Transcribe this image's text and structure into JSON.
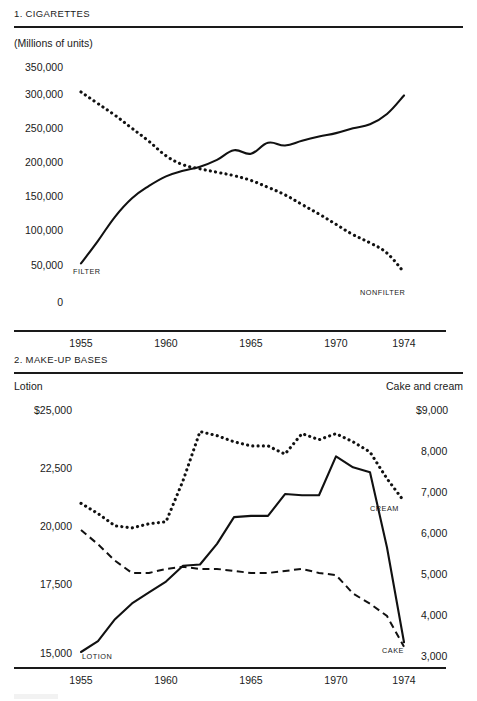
{
  "page": {
    "background": "#ffffff",
    "ink": "#111111"
  },
  "panels": [
    {
      "id": "cigarettes",
      "number_title": "1. CIGARETTES",
      "unit_label": "(Millions of units)",
      "y_ticks": [
        "350,000",
        "300,000",
        "250,000",
        "200,000",
        "150,000",
        "100,000",
        "50,000",
        "0"
      ],
      "x_ticks": [
        "1955",
        "1960",
        "1965",
        "1970",
        "1974"
      ],
      "series_labels": [
        {
          "name": "filter-label",
          "text": "FILTER"
        },
        {
          "name": "nonfilter-label",
          "text": "NONFILTER"
        }
      ]
    },
    {
      "id": "makeup",
      "number_title": "2. MAKE-UP BASES",
      "left_axis_title": "Lotion",
      "right_axis_title": "Cake and cream",
      "y_ticks_left": [
        "$25,000",
        "22,500",
        "20,000",
        "17,500",
        "15,000"
      ],
      "y_ticks_right": [
        "$9,000",
        "8,000",
        "7,000",
        "6,000",
        "5,000",
        "4,000",
        "3,000"
      ],
      "x_ticks": [
        "1955",
        "1960",
        "1965",
        "1970",
        "1974"
      ],
      "series_labels": [
        {
          "name": "lotion-label",
          "text": "LOTION"
        },
        {
          "name": "cream-label",
          "text": "CREAM"
        },
        {
          "name": "cake-label",
          "text": "CAKE"
        }
      ]
    }
  ],
  "chart_data": [
    {
      "type": "line",
      "title": "1. CIGARETTES",
      "subtitle": "(Millions of units)",
      "xlabel": "",
      "ylabel": "(Millions of units)",
      "xlim": [
        1955,
        1974
      ],
      "ylim": [
        0,
        350000
      ],
      "yticks": [
        0,
        50000,
        100000,
        150000,
        200000,
        250000,
        300000,
        350000
      ],
      "xticks": [
        1955,
        1960,
        1965,
        1970,
        1974
      ],
      "grid": false,
      "legend": "inline-annotations",
      "x": [
        1955,
        1956,
        1957,
        1958,
        1959,
        1960,
        1961,
        1962,
        1963,
        1964,
        1965,
        1966,
        1967,
        1968,
        1969,
        1970,
        1971,
        1972,
        1973,
        1974
      ],
      "series": [
        {
          "name": "FILTER",
          "style": "solid",
          "values": [
            65000,
            98000,
            133000,
            160000,
            178000,
            192000,
            200000,
            206000,
            216000,
            230000,
            225000,
            241000,
            237000,
            244000,
            250000,
            255000,
            262000,
            268000,
            283000,
            310000
          ]
        },
        {
          "name": "NONFILTER",
          "style": "dotted",
          "values": [
            315000,
            298000,
            281000,
            262000,
            243000,
            222000,
            209000,
            203000,
            198000,
            193000,
            186000,
            176000,
            165000,
            151000,
            137000,
            122000,
            107000,
            95000,
            80000,
            52000
          ]
        }
      ]
    },
    {
      "type": "line",
      "title": "2. MAKE-UP BASES",
      "xlabel": "",
      "ylabel_left": "Lotion",
      "ylabel_right": "Cake and cream",
      "xlim": [
        1955,
        1974
      ],
      "ylim_left": [
        15000,
        25000
      ],
      "ylim_right": [
        3000,
        9000
      ],
      "yticks_left": [
        15000,
        17500,
        20000,
        22500,
        25000
      ],
      "yticks_right": [
        3000,
        4000,
        5000,
        6000,
        7000,
        8000,
        9000
      ],
      "xticks": [
        1955,
        1960,
        1965,
        1970,
        1974
      ],
      "grid": false,
      "legend": "inline-annotations",
      "x": [
        1955,
        1956,
        1957,
        1958,
        1959,
        1960,
        1961,
        1962,
        1963,
        1964,
        1965,
        1966,
        1967,
        1968,
        1969,
        1970,
        1971,
        1972,
        1973,
        1974
      ],
      "series": [
        {
          "name": "LOTION",
          "axis": "left",
          "style": "solid",
          "values": [
            15000,
            15450,
            16350,
            17000,
            17450,
            17900,
            18550,
            18600,
            19450,
            20550,
            20600,
            20600,
            21500,
            21450,
            21450,
            23050,
            22600,
            22400,
            19300,
            15400
          ]
        },
        {
          "name": "CREAM",
          "axis": "right",
          "style": "dotted",
          "values": [
            6700,
            6450,
            6150,
            6100,
            6200,
            6250,
            7250,
            8450,
            8350,
            8200,
            8100,
            8100,
            7900,
            8400,
            8250,
            8400,
            8200,
            7950,
            7300,
            6750
          ]
        },
        {
          "name": "CAKE",
          "axis": "right",
          "style": "dashed",
          "values": [
            6050,
            5700,
            5300,
            5000,
            5000,
            5100,
            5150,
            5100,
            5100,
            5050,
            5000,
            5000,
            5050,
            5100,
            5000,
            4950,
            4500,
            4250,
            3950,
            3200
          ]
        }
      ]
    }
  ]
}
